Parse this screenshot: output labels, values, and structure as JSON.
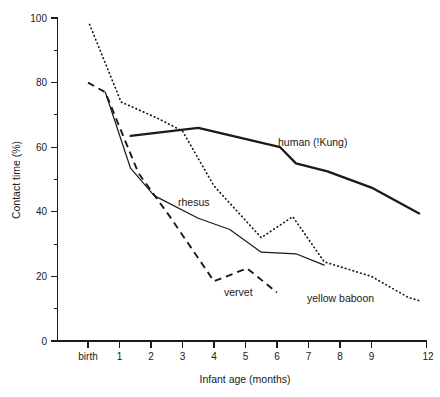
{
  "chart_data": {
    "type": "line",
    "title": "",
    "xlabel": "Infant age (months)",
    "ylabel": "Contact time (%)",
    "xlim": [
      -0.5,
      12
    ],
    "ylim": [
      0,
      100
    ],
    "grid": false,
    "legend_position": "inline-annotations",
    "y_ticks_major": [
      0,
      20,
      40,
      60,
      80,
      100
    ],
    "y_ticks_minor": [
      10,
      30,
      50,
      70,
      90
    ],
    "x_tick_labels": [
      "birth",
      "1",
      "2",
      "3",
      "4",
      "5",
      "6",
      "7",
      "8",
      "9",
      "12"
    ],
    "x_tick_values": [
      0,
      1,
      2,
      3,
      4,
      5,
      6,
      7,
      8,
      9,
      12
    ],
    "series": [
      {
        "name": "human (!Kung)",
        "style": "thick-solid",
        "label_x": 7.1,
        "label_y": 60.5,
        "x": [
          1.35,
          3.5,
          6.1,
          6.6,
          7.6,
          9.0,
          11.6
        ],
        "values": [
          63.5,
          66.0,
          60.0,
          55.0,
          52.5,
          47.5,
          39.5
        ]
      },
      {
        "name": "rhesus",
        "style": "thin-solid",
        "label_x": 3.05,
        "label_y": 43.0,
        "x": [
          0.55,
          1.35,
          2.1,
          3.5,
          4.5,
          5.5,
          6.6,
          7.5
        ],
        "values": [
          77.0,
          53.5,
          45.0,
          38.0,
          34.5,
          27.5,
          27.0,
          23.5
        ]
      },
      {
        "name": "vervet",
        "style": "dashed",
        "label_x": 4.85,
        "label_y": 15.5,
        "x": [
          0.0,
          0.55,
          1.6,
          2.6,
          4.0,
          5.05,
          6.0
        ],
        "values": [
          80.0,
          77.0,
          52.0,
          38.5,
          18.5,
          22.5,
          15.0
        ]
      },
      {
        "name": "yellow baboon",
        "style": "dotted",
        "label_x": 7.3,
        "label_y": 13.5,
        "x": [
          0.05,
          1.05,
          2.2,
          3.0,
          4.0,
          5.5,
          6.5,
          7.5,
          9.0,
          11.0,
          11.6
        ],
        "values": [
          98.0,
          74.0,
          69.0,
          65.0,
          48.0,
          32.0,
          38.5,
          24.5,
          20.0,
          13.5,
          12.5
        ]
      }
    ]
  },
  "axes": {
    "y_axis_title": "Contact time (%)",
    "x_axis_title": "Infant age (months)",
    "y_labels": [
      "100",
      "80",
      "60",
      "40",
      "20",
      "0"
    ],
    "x_labels": [
      "birth",
      "1",
      "2",
      "3",
      "4",
      "5",
      "6",
      "7",
      "8",
      "9",
      "12"
    ]
  },
  "annotations": {
    "human": "human (!Kung)",
    "rhesus": "rhesus",
    "vervet": "vervet",
    "baboon": "yellow baboon"
  },
  "caption": ""
}
